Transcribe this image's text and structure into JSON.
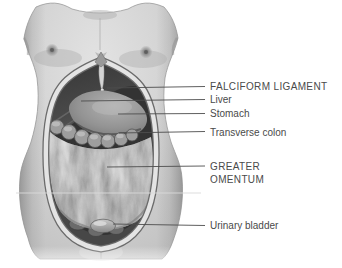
{
  "figure": {
    "labels": {
      "falciform_ligament": "FALCIFORM LIGAMENT",
      "liver": "Liver",
      "stomach": "Stomach",
      "transverse_colon": "Transverse colon",
      "greater_omentum_line1": "GREATER",
      "greater_omentum_line2": "OMENTUM",
      "urinary_bladder": "Urinary bladder"
    },
    "colors": {
      "background": "#ffffff",
      "label_text": "#4a4a4a",
      "leader_line": "#4d4d4d",
      "skin": "#cccccc",
      "cut_edge": "#e4e4e4",
      "cavity": "#2e2e2e",
      "liver": "#454545",
      "stomach": "#8d8d8d",
      "transverse_colon": "#9e9e9e",
      "greater_omentum": "#c6c6c6",
      "urinary_bladder": "#a8a8a8"
    }
  }
}
